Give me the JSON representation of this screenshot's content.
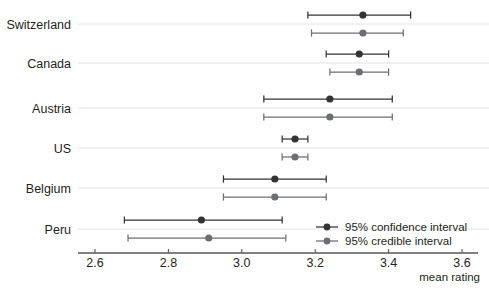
{
  "chart_data": {
    "type": "scatter",
    "title": "",
    "xlabel": "mean rating",
    "ylabel": "",
    "xlim": [
      2.54,
      3.66
    ],
    "xticks": [
      2.6,
      2.8,
      3.0,
      3.2,
      3.4,
      3.6
    ],
    "xticklabels": [
      "2.6",
      "2.8",
      "3.0",
      "3.2",
      "3.4",
      "3.6"
    ],
    "categories": [
      "Switzerland",
      "Canada",
      "Austria",
      "US",
      "Belgium",
      "Peru"
    ],
    "grid": true,
    "grid_axis": "y",
    "legend_position": "bottom-right",
    "series": [
      {
        "name": "95% confidence interval",
        "color": "#333333",
        "values": [
          3.33,
          3.32,
          3.24,
          3.145,
          3.09,
          2.89
        ],
        "lower": [
          3.18,
          3.23,
          3.06,
          3.11,
          2.95,
          2.68
        ],
        "upper": [
          3.46,
          3.4,
          3.41,
          3.18,
          3.23,
          3.11
        ]
      },
      {
        "name": "95% credible interval",
        "color": "#6d6e71",
        "values": [
          3.33,
          3.32,
          3.24,
          3.145,
          3.09,
          2.91
        ],
        "lower": [
          3.19,
          3.24,
          3.06,
          3.11,
          2.95,
          2.69
        ],
        "upper": [
          3.44,
          3.4,
          3.41,
          3.18,
          3.23,
          3.12
        ]
      }
    ]
  },
  "legend": {
    "items": [
      {
        "label": "95% confidence interval",
        "color": "#333333"
      },
      {
        "label": "95% credible interval",
        "color": "#6d6e71"
      }
    ]
  },
  "axis": {
    "x_title": "mean rating"
  },
  "categories": {
    "0": "Switzerland",
    "1": "Canada",
    "2": "Austria",
    "3": "US",
    "4": "Belgium",
    "5": "Peru"
  },
  "ticks": {
    "0": "2.6",
    "1": "2.8",
    "2": "3.0",
    "3": "3.2",
    "4": "3.4",
    "5": "3.6"
  }
}
